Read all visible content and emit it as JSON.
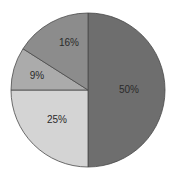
{
  "chart_data": {
    "type": "pie",
    "title": "",
    "categories": [
      "A",
      "B",
      "C",
      "D"
    ],
    "values": [
      50,
      25,
      9,
      16
    ],
    "labels": [
      "50%",
      "25%",
      "9%",
      "16%"
    ],
    "colors": [
      "#6e6e6e",
      "#d4d4d4",
      "#ababab",
      "#8c8c8c"
    ],
    "start_angle_deg": 0,
    "direction": "clockwise",
    "legend": null
  },
  "labels": {
    "s0": "50%",
    "s1": "25%",
    "s2": "9%",
    "s3": "16%"
  }
}
